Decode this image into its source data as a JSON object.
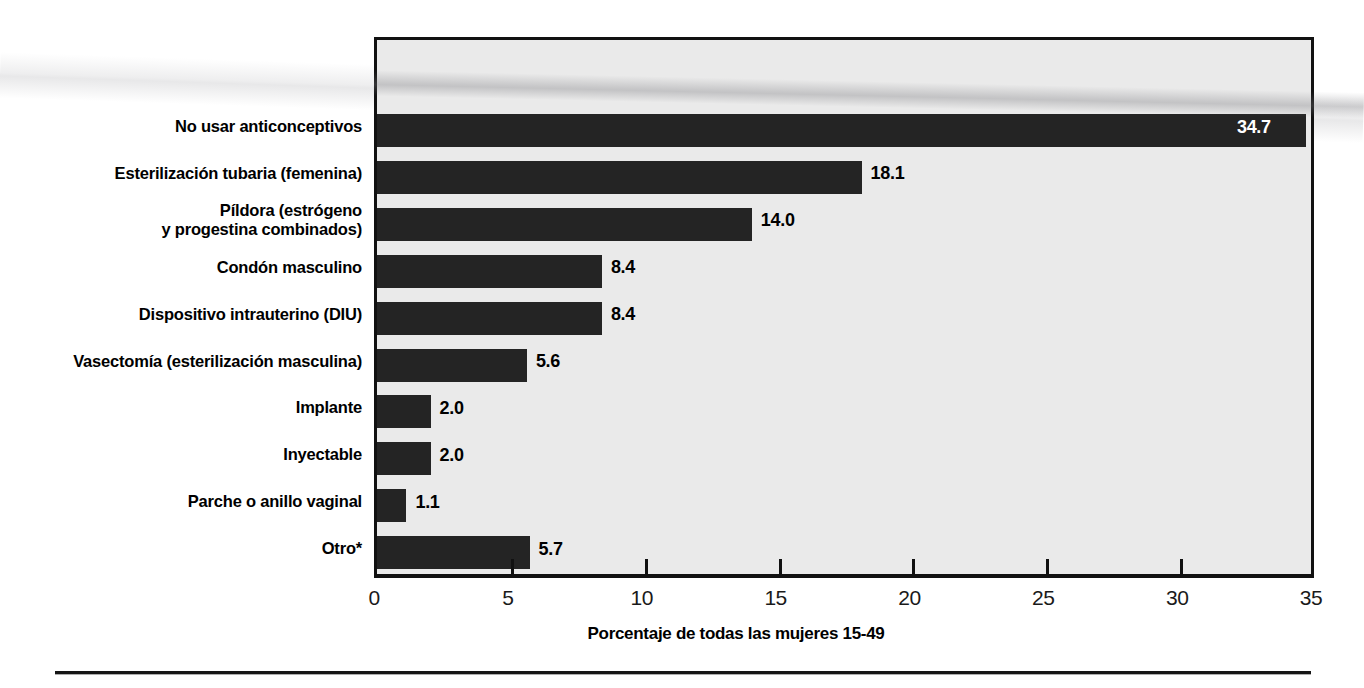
{
  "chart_data": {
    "type": "bar",
    "orientation": "horizontal",
    "title": "",
    "xlabel": "Porcentaje de todas las mujeres 15-49",
    "ylabel": "",
    "xlim": [
      0,
      35
    ],
    "xticks": [
      0,
      5,
      10,
      15,
      20,
      25,
      30,
      35
    ],
    "xtick_labels": [
      "0",
      "5",
      "10",
      "15",
      "20",
      "25",
      "30",
      "35"
    ],
    "grid": false,
    "legend": false,
    "bar_color": "#242424",
    "plot_background": "#eaeaea",
    "frame_color": "#111111",
    "categories": [
      "No usar anticonceptivos",
      "Esterilización tubaria (femenina)",
      "Píldora (estrógeno\ny progestina combinados)",
      "Condón masculino",
      "Dispositivo intrauterino (DIU)",
      "Vasectomía (esterilización masculina)",
      "Implante",
      "Inyectable",
      "Parche o anillo vaginal",
      "Otro*"
    ],
    "values": [
      34.7,
      18.1,
      14.0,
      8.4,
      8.4,
      5.6,
      2.0,
      2.0,
      1.1,
      5.7
    ],
    "value_labels": [
      "34.7",
      "18.1",
      "14.0",
      "8.4",
      "8.4",
      "5.6",
      "2.0",
      "2.0",
      "1.1",
      "5.7"
    ],
    "label_placement": [
      "inside",
      "outside",
      "outside",
      "outside",
      "outside",
      "outside",
      "outside",
      "outside",
      "outside",
      "outside"
    ]
  },
  "axis": {
    "title": "Porcentaje de todas las mujeres 15-49"
  }
}
